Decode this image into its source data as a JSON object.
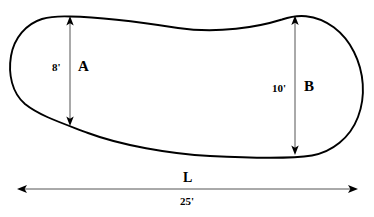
{
  "diagram": {
    "shape_name": "irregular-blob-outline",
    "stroke_color": "#000000",
    "fill_color": "#ffffff",
    "background_color": "#ffffff"
  },
  "labels": {
    "width_a_value": "8'",
    "region_a": "A",
    "width_b_value": "10'",
    "region_b": "B",
    "length_symbol": "L",
    "length_value": "25'"
  },
  "measurements": [
    {
      "name": "A",
      "label": "8'",
      "orientation": "vertical",
      "value": 8,
      "unit": "ft"
    },
    {
      "name": "B",
      "label": "10'",
      "orientation": "vertical",
      "value": 10,
      "unit": "ft"
    },
    {
      "name": "L",
      "label": "25'",
      "orientation": "horizontal",
      "value": 25,
      "unit": "ft"
    }
  ]
}
